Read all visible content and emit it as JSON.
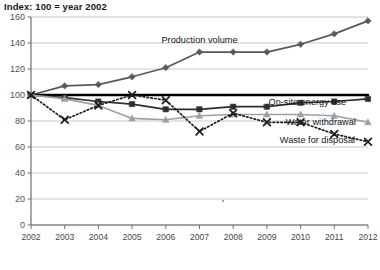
{
  "chart_data": {
    "type": "line",
    "title": "Index: 100 = year 2002",
    "xlabel": "",
    "ylabel": "",
    "ylim": [
      0,
      160
    ],
    "ytick_values": [
      0,
      20,
      40,
      60,
      80,
      100,
      120,
      140,
      160
    ],
    "ytick_labels": [
      "0",
      "20",
      "40",
      "60",
      "80",
      "100",
      "120",
      "140",
      "160"
    ],
    "grid": true,
    "legend_position": "inline-annotations",
    "categories": [
      "2002",
      "2003",
      "2004",
      "2005",
      "2006",
      "2007",
      "2008",
      "2009",
      "2010",
      "2011",
      "2012"
    ],
    "x": [
      2002,
      2003,
      2004,
      2005,
      2006,
      2007,
      2008,
      2009,
      2010,
      2011,
      2012
    ],
    "series": [
      {
        "name": "Production volume",
        "marker": "diamond",
        "linestyle": "solid",
        "color": "#55585c",
        "values": [
          100,
          107,
          108,
          114,
          121,
          133,
          133,
          133,
          139,
          147,
          157
        ]
      },
      {
        "name": "Reference line",
        "marker": "none",
        "linestyle": "solid",
        "color": "#000000",
        "values": [
          100,
          100,
          100,
          100,
          100,
          100,
          100,
          100,
          100,
          100,
          100
        ]
      },
      {
        "name": "On-site energy use",
        "marker": "square",
        "linestyle": "solid",
        "color": "#2b2d30",
        "values": [
          100,
          98,
          95,
          93,
          89,
          89,
          91,
          91,
          94,
          95,
          97
        ]
      },
      {
        "name": "Water withdrawal",
        "marker": "triangle",
        "linestyle": "solid",
        "color": "#9ba0a4",
        "values": [
          100,
          97,
          92,
          82,
          81,
          84,
          85,
          85,
          85,
          84,
          79
        ]
      },
      {
        "name": "Waste for disposal",
        "marker": "cross",
        "linestyle": "dotted",
        "color": "#1a1c1f",
        "values": [
          100,
          81,
          92,
          100,
          96,
          72,
          86,
          79,
          79,
          70,
          64
        ]
      }
    ],
    "annotations": [
      {
        "text": "Production volume",
        "x": 2007.0,
        "y": 140,
        "anchor": "middle"
      },
      {
        "text": "On-site energy use",
        "x": 2010.2,
        "y": 92,
        "anchor": "middle"
      },
      {
        "text": "Water withdrawal",
        "x": 2010.6,
        "y": 77,
        "anchor": "middle"
      },
      {
        "text": "Waste for disposal",
        "x": 2010.5,
        "y": 63,
        "anchor": "middle"
      }
    ]
  }
}
